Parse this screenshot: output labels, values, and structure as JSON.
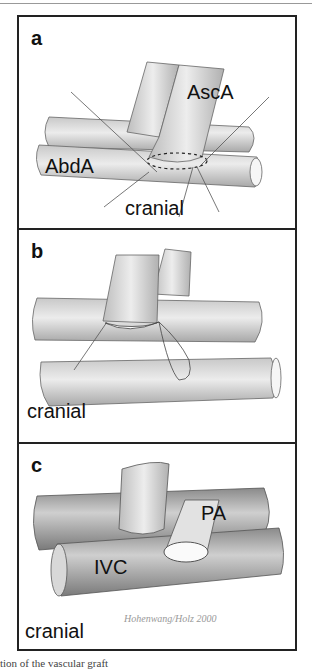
{
  "figure": {
    "panels": [
      {
        "id": "a",
        "label": "a",
        "annotations": [
          "AscA",
          "AbdA",
          "cranial"
        ]
      },
      {
        "id": "b",
        "label": "b",
        "annotations": [
          "cranial"
        ]
      },
      {
        "id": "c",
        "label": "c",
        "annotations": [
          "PA",
          "IVC",
          "cranial"
        ]
      }
    ],
    "signature": "Hohenwang / 2000"
  },
  "caption": "tion of the vascular graft"
}
